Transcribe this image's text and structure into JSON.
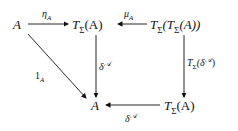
{
  "diagram": {
    "type": "commutative-diagram",
    "nodes": {
      "a_top": {
        "main": "A"
      },
      "t_a_top": {
        "main": "T",
        "sub": "Σ",
        "arg": "(A)"
      },
      "t_t_a": {
        "main": "T",
        "sub": "Σ",
        "arg_pre": "(T",
        "arg_sub": "Σ",
        "arg_post": "(A))"
      },
      "a_bottom": {
        "main": "A"
      },
      "t_a_bottom": {
        "main": "T",
        "sub": "Σ",
        "arg": "(A)"
      }
    },
    "arrows": [
      {
        "id": "eta",
        "from": "A",
        "to": "TΣ(A)",
        "label": "η",
        "label_sub": "A"
      },
      {
        "id": "mu",
        "from": "TΣ(TΣ(A))",
        "to": "TΣ(A)",
        "label": "μ",
        "label_sub": "A"
      },
      {
        "id": "identity",
        "from": "A",
        "to": "A",
        "label": "1",
        "label_sub": "A"
      },
      {
        "id": "delta-left",
        "from": "TΣ(A)",
        "to": "A",
        "label": "δ",
        "label_sup": "𝒜"
      },
      {
        "id": "t-delta",
        "from": "TΣ(TΣ(A))",
        "to": "TΣ(A)",
        "label_pre": "T",
        "label_pre_sub": "Σ",
        "label": "(δ",
        "label_sup": "𝒜",
        "label_post": ")"
      },
      {
        "id": "delta-bottom",
        "from": "TΣ(A)",
        "to": "A",
        "label": "δ",
        "label_sup": "𝒜"
      }
    ]
  }
}
